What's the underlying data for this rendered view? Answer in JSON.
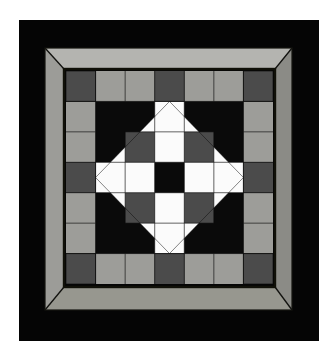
{
  "artwork": {
    "title": "Framed geometric quilt block",
    "caption": "",
    "canvas": {
      "width": 333,
      "height": 353,
      "background": "#ffffff"
    },
    "mat": {
      "name": "black mat",
      "color": "#050505",
      "x": 19,
      "y": 20,
      "width": 300,
      "height": 321
    },
    "frame": {
      "name": "mitred gray frame",
      "outer": {
        "x": 45,
        "y": 48,
        "width": 247,
        "height": 262
      },
      "inner": {
        "x": 64,
        "y": 69,
        "width": 211,
        "height": 218
      },
      "face_color": "#a0a09c",
      "top_color": "#b4b4b0",
      "left_color": "#9a9a96",
      "right_color": "#8c8c88",
      "bottom_color": "#96968f",
      "miter_line_color": "#14140f"
    },
    "quilt": {
      "name": "seven by seven pieced block",
      "x": 66,
      "y": 71,
      "width": 207,
      "height": 213,
      "grid": {
        "cols": 7,
        "rows": 7
      },
      "seam_color": "#0a0a0a",
      "seam_width": 1.4,
      "palette": {
        "black": "#0a0a0a",
        "white": "#fbfbfb",
        "light_gray": "#9d9d99",
        "dark_gray": "#4b4b4b"
      },
      "layers": [
        {
          "name": "background",
          "shape": "rect",
          "fill": "black"
        },
        {
          "name": "corner-squares",
          "shape": "squares",
          "fill": "dark_gray",
          "cells": [
            [
              0,
              0
            ],
            [
              6,
              0
            ],
            [
              0,
              6
            ],
            [
              6,
              6
            ]
          ]
        },
        {
          "name": "edge-bars",
          "shape": "rects",
          "fill": "light_gray",
          "cells": [
            [
              1,
              0,
              2,
              1
            ],
            [
              4,
              0,
              2,
              1
            ],
            [
              1,
              6,
              2,
              1
            ],
            [
              4,
              6,
              2,
              1
            ],
            [
              0,
              1,
              1,
              2
            ],
            [
              0,
              4,
              1,
              2
            ],
            [
              6,
              1,
              1,
              2
            ],
            [
              6,
              4,
              1,
              2
            ]
          ]
        },
        {
          "name": "edge-midpoint-cells",
          "shape": "squares",
          "fill": "dark_gray",
          "cells": [
            [
              3,
              0
            ],
            [
              0,
              3
            ],
            [
              6,
              3
            ],
            [
              3,
              6
            ]
          ]
        },
        {
          "name": "on-point-diamond",
          "shape": "diamond",
          "fill": "white",
          "points": "half-drop square rotated 45 degrees spanning columns 1-6 rows 1-6"
        },
        {
          "name": "inner-white-squares",
          "shape": "squares",
          "fill": "white",
          "cells": [
            [
              3,
              1
            ],
            [
              1,
              3
            ],
            [
              5,
              3
            ],
            [
              3,
              5
            ]
          ]
        },
        {
          "name": "dark-gray-accents",
          "shape": "squares",
          "fill": "dark_gray",
          "cells": [
            [
              2,
              2
            ],
            [
              4,
              2
            ],
            [
              2,
              4
            ],
            [
              4,
              4
            ]
          ]
        },
        {
          "name": "center-square",
          "shape": "square",
          "fill": "black",
          "cells": [
            [
              3,
              3
            ]
          ]
        }
      ]
    }
  }
}
